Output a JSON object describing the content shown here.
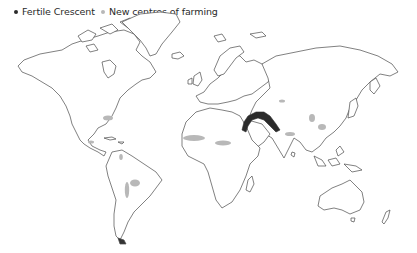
{
  "legend": {
    "items": [
      {
        "label": "Fertile Crescent",
        "color": "#2b2b2b"
      },
      {
        "label": "New centres of farming",
        "color": "#b8b8b8"
      }
    ]
  },
  "map": {
    "type": "world outline map",
    "colors": {
      "fertile_crescent": "#2b2b2b",
      "new_centres": "#b8b8b8",
      "coastline": "#4a4a4a",
      "land": "#ffffff"
    },
    "regions": {
      "fertile_crescent": [
        {
          "name": "Fertile Crescent (Middle East)",
          "cx": 278,
          "cy": 122
        }
      ],
      "new_centres": [
        {
          "name": "Eastern North America",
          "cx": 108,
          "cy": 118
        },
        {
          "name": "Central America",
          "cx": 91,
          "cy": 142
        },
        {
          "name": "Northern Andes",
          "cx": 121,
          "cy": 157
        },
        {
          "name": "Andes",
          "cx": 127,
          "cy": 190
        },
        {
          "name": "Amazonia",
          "cx": 135,
          "cy": 183
        },
        {
          "name": "West African Sahel",
          "cx": 194,
          "cy": 137
        },
        {
          "name": "Central Sahel",
          "cx": 223,
          "cy": 143
        },
        {
          "name": "Ethiopian Highlands",
          "cx": 242,
          "cy": 151
        },
        {
          "name": "Central Asia",
          "cx": 278,
          "cy": 100
        },
        {
          "name": "Northern China",
          "cx": 314,
          "cy": 117
        },
        {
          "name": "Yangtze River",
          "cx": 321,
          "cy": 127
        },
        {
          "name": "Indian Subcontinent",
          "cx": 289,
          "cy": 133
        },
        {
          "name": "New Guinea",
          "cx": 350,
          "cy": 172
        }
      ]
    }
  }
}
